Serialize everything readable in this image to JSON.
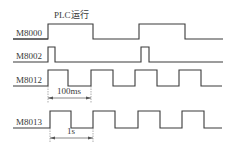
{
  "title": "PLC运行",
  "signals": [
    {
      "name": "M8000",
      "description": "RUN monitor: ON while PLC running",
      "transitions": [
        "rise",
        "fall",
        "rise",
        "fall"
      ]
    },
    {
      "name": "M8002",
      "description": "Initial pulse: one scan at start of RUN",
      "transitions": [
        "rise",
        "fall",
        "rise",
        "fall"
      ]
    },
    {
      "name": "M8012",
      "description": "100 ms clock pulse",
      "period_label": "100ms"
    },
    {
      "name": "M8013",
      "description": "1 s clock pulse",
      "period_label": "1s"
    }
  ],
  "annotations": {
    "run_label": "PLC运行",
    "m8012_period": "100ms",
    "m8013_period": "1s"
  },
  "colors": {
    "line": "#3a3a3a",
    "background": "#ffffff"
  }
}
